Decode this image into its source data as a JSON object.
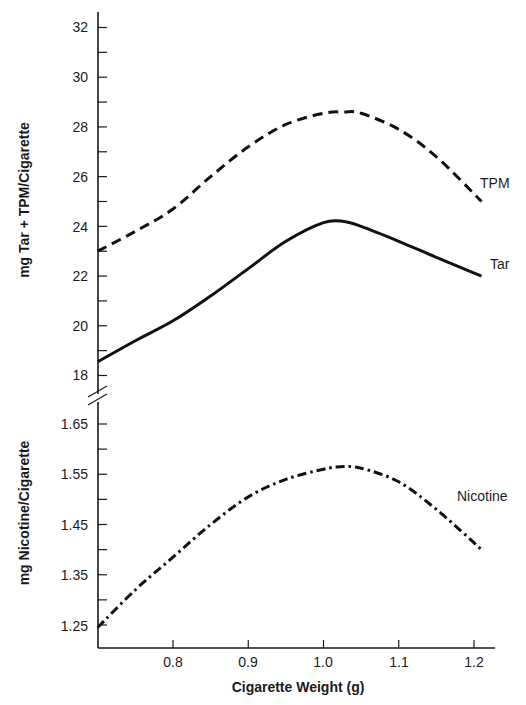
{
  "chart_data": [
    {
      "type": "line",
      "panel": "upper",
      "title": "",
      "xlabel": "Cigarette Weight (g)",
      "ylabel": "mg Tar + TPM/Cigarette",
      "xlim": [
        0.7,
        1.23
      ],
      "ylim": [
        17.7,
        32.6
      ],
      "y_ticks": [
        18,
        20,
        22,
        24,
        26,
        28,
        30,
        32
      ],
      "y_minor_ticks": [
        19,
        21,
        23,
        25,
        27,
        29,
        31
      ],
      "grid": false,
      "legend": "inline labels at right end of curves",
      "x": [
        0.7,
        0.75,
        0.8,
        0.85,
        0.9,
        0.95,
        1.0,
        1.027,
        1.05,
        1.1,
        1.15,
        1.21
      ],
      "series": [
        {
          "name": "TPM",
          "style": "dashed",
          "values": [
            23.0,
            23.8,
            24.7,
            26.0,
            27.2,
            28.1,
            28.55,
            28.6,
            28.55,
            27.9,
            26.8,
            25.0
          ]
        },
        {
          "name": "Tar",
          "style": "solid",
          "values": [
            18.55,
            19.4,
            20.2,
            21.2,
            22.3,
            23.4,
            24.15,
            24.2,
            24.0,
            23.4,
            22.75,
            22.0
          ]
        }
      ]
    },
    {
      "type": "line",
      "panel": "lower",
      "title": "",
      "xlabel": "Cigarette Weight (g)",
      "ylabel": "mg Nicotine/Cigarette",
      "xlim": [
        0.7,
        1.23
      ],
      "ylim": [
        1.21,
        1.7
      ],
      "y_ticks": [
        1.25,
        1.35,
        1.45,
        1.55,
        1.65
      ],
      "y_minor_ticks": [
        1.3,
        1.4,
        1.5,
        1.6
      ],
      "x_ticks": [
        0.8,
        0.9,
        1.0,
        1.1,
        1.2
      ],
      "grid": false,
      "legend": "inline label at right end of curve",
      "x": [
        0.7,
        0.75,
        0.8,
        0.85,
        0.9,
        0.95,
        1.0,
        1.023,
        1.05,
        1.1,
        1.15,
        1.21
      ],
      "series": [
        {
          "name": "Nicotine",
          "style": "dash-dot",
          "values": [
            1.245,
            1.32,
            1.385,
            1.45,
            1.505,
            1.54,
            1.56,
            1.565,
            1.562,
            1.535,
            1.48,
            1.4
          ]
        }
      ]
    }
  ],
  "axes": {
    "x_ticks": [
      "0.8",
      "0.9",
      "1.0",
      "1.1",
      "1.2"
    ],
    "upper_y_ticks": [
      "32",
      "30",
      "28",
      "26",
      "24",
      "22",
      "20",
      "18"
    ],
    "lower_y_ticks": [
      "1.65",
      "1.55",
      "1.45",
      "1.35",
      "1.25"
    ],
    "xlabel": "Cigarette Weight (g)",
    "upper_ylabel": "mg Tar + TPM/Cigarette",
    "lower_ylabel": "mg Nicotine/Cigarette"
  },
  "labels": {
    "tpm": "TPM",
    "tar": "Tar",
    "nicotine": "Nicotine"
  }
}
